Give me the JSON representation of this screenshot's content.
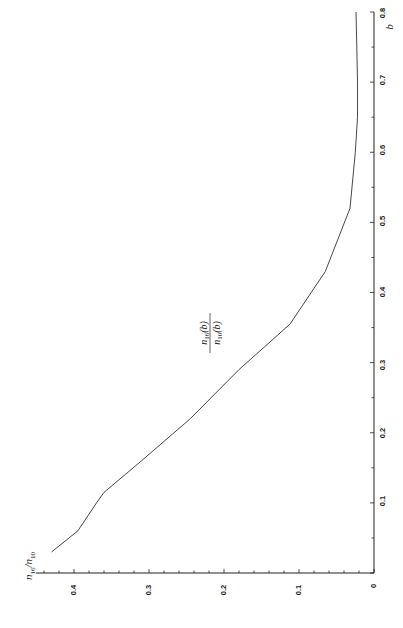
{
  "chart_data": {
    "type": "line",
    "orientation": "rotated 90deg counter-clockwise (b axis runs bottom-to-top along right edge, value axis runs right-to-left along bottom edge)",
    "title": "",
    "xlabel": "b",
    "ylabel": "n_16/n_10",
    "xlim": [
      0,
      0.8
    ],
    "ylim": [
      0,
      0.45
    ],
    "x_ticks": [
      "0",
      "0.1",
      "0.2",
      "0.3",
      "0.4",
      "0.5",
      "0.6",
      "0.7",
      "0.8"
    ],
    "y_ticks": [
      "0",
      "0.1",
      "0.2",
      "0.3",
      "0.4"
    ],
    "grid": false,
    "legend": null,
    "annotations": [
      {
        "text": "n_16(b) / n_10(b)",
        "x": 0.3,
        "y": 0.21
      }
    ],
    "series": [
      {
        "name": "n_16(b)/n_10(b)",
        "x": [
          0.03,
          0.06,
          0.1,
          0.115,
          0.16,
          0.22,
          0.29,
          0.355,
          0.43,
          0.52,
          0.6,
          0.65,
          0.7,
          0.75,
          0.8
        ],
        "y": [
          0.43,
          0.395,
          0.37,
          0.36,
          0.31,
          0.245,
          0.18,
          0.112,
          0.065,
          0.032,
          0.025,
          0.022,
          0.022,
          0.023,
          0.024
        ]
      }
    ]
  },
  "labels": {
    "xlabel": "b",
    "ylabel_main": "n",
    "ylabel_sub1": "16",
    "ylabel_slash": "/n",
    "ylabel_sub2": "10",
    "annot_num": "n",
    "annot_num_sub": "16",
    "annot_num_arg": "(b)",
    "annot_den": "n",
    "annot_den_sub": "10",
    "annot_den_arg": "(b)"
  },
  "x_tick_labels": [
    "0.1",
    "0.2",
    "0.3",
    "0.4",
    "0.5",
    "0.6",
    "0.7",
    "0.8"
  ],
  "y_tick_labels": [
    "0",
    "0.1",
    "0.2",
    "0.3",
    "0.4"
  ]
}
